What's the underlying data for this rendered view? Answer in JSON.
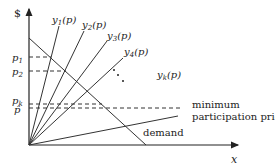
{
  "diagram": {
    "y_axis_label": "$",
    "x_axis_label": "x",
    "price_labels": {
      "p1": "p",
      "p1_sub": "1",
      "p2": "p",
      "p2_sub": "2",
      "pk": "p",
      "pk_sub": "k",
      "phat": "p̂"
    },
    "supply_curves": [
      {
        "name": "y",
        "sub": "1",
        "arg": "(p)"
      },
      {
        "name": "y",
        "sub": "2",
        "arg": "(p)"
      },
      {
        "name": "y",
        "sub": "3",
        "arg": "(p)"
      },
      {
        "name": "y",
        "sub": "4",
        "arg": "(p)"
      },
      {
        "name": "y",
        "sub": "k",
        "arg": "(p)"
      }
    ],
    "ellipsis": "⋱",
    "demand_label": "demand",
    "min_price_label_line1": "minimum",
    "min_price_label_line2": "participation price"
  }
}
